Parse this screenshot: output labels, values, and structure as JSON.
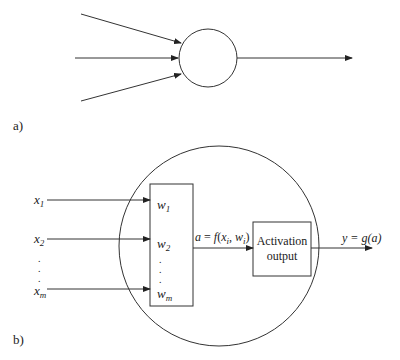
{
  "diagram": {
    "panel_a": {
      "label": "a)",
      "description": "Simple neuron: three inputs into a node, one output"
    },
    "panel_b": {
      "label": "b)",
      "inputs": [
        {
          "var": "x",
          "sub": "1"
        },
        {
          "var": "x",
          "sub": "2"
        },
        {
          "var": "x",
          "sub": "m"
        }
      ],
      "weights": [
        {
          "var": "w",
          "sub": "1"
        },
        {
          "var": "w",
          "sub": "2"
        },
        {
          "var": "w",
          "sub": "m"
        }
      ],
      "ellipsis": ".",
      "aggregation": {
        "prefix": "a = f(",
        "x": "x",
        "x_sub": "i",
        "sep": ", ",
        "w": "w",
        "w_sub": "i",
        "suffix": ")"
      },
      "activation_box": {
        "line1": "Activation",
        "line2": "output"
      },
      "output_label": "y = g(a)"
    },
    "colors": {
      "stroke": "#333333",
      "background": "#ffffff"
    }
  }
}
